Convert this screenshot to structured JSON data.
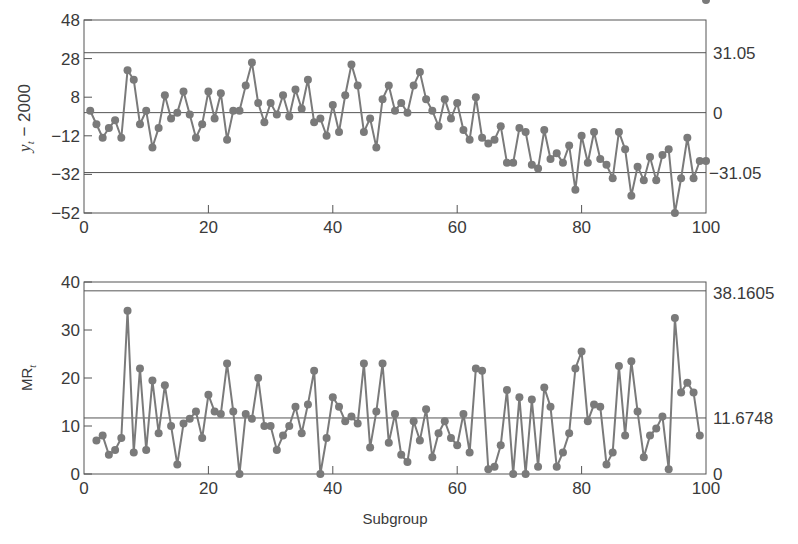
{
  "chart_data": [
    {
      "type": "line",
      "title": "",
      "xlabel": "",
      "ylabel": "y_t − 2000",
      "xlim": [
        0,
        100
      ],
      "ylim": [
        -52,
        48
      ],
      "x_ticks": [
        0,
        20,
        40,
        60,
        80,
        100
      ],
      "y_ticks": [
        48,
        28,
        8,
        -12,
        -32,
        -52
      ],
      "grid": false,
      "control_limits": {
        "UCL": 31.05,
        "CL": 0,
        "LCL": -31.05
      },
      "right_labels": [
        "31.05",
        "0",
        "-31.05"
      ],
      "series": [
        {
          "name": "y_t - 2000",
          "x": [
            1,
            2,
            3,
            4,
            5,
            6,
            7,
            8,
            9,
            10,
            11,
            12,
            13,
            14,
            15,
            16,
            17,
            18,
            19,
            20,
            21,
            22,
            23,
            24,
            25,
            26,
            27,
            28,
            29,
            30,
            31,
            32,
            33,
            34,
            35,
            36,
            37,
            38,
            39,
            40,
            41,
            42,
            43,
            44,
            45,
            46,
            47,
            48,
            49,
            50,
            51,
            52,
            53,
            54,
            55,
            56,
            57,
            58,
            59,
            60,
            61,
            62,
            63,
            64,
            65,
            66,
            67,
            68,
            69,
            70,
            71,
            72,
            73,
            74,
            75,
            76,
            77,
            78,
            79,
            80,
            81,
            82,
            83,
            84,
            85,
            86,
            87,
            88,
            89,
            90,
            91,
            92,
            93,
            94,
            95,
            96,
            97,
            98,
            99,
            100
          ],
          "values": [
            1,
            -6,
            -13,
            -8,
            -4,
            -13,
            22,
            17,
            -6,
            1,
            -18,
            -8,
            9,
            -3,
            0,
            11,
            -1,
            -13,
            -6,
            11,
            -3,
            10,
            -14,
            1,
            1,
            14,
            26,
            5,
            -5,
            5,
            -1,
            9,
            -2,
            12,
            2,
            17,
            -5,
            -3,
            -12,
            4,
            -10,
            9,
            25,
            14,
            -10,
            -3,
            -18,
            7,
            14,
            1,
            5,
            0,
            14,
            21,
            7,
            1,
            -7,
            7,
            -3,
            5,
            -9,
            -14,
            8,
            -13,
            -16,
            -14,
            -7,
            -26,
            -26,
            -8,
            -10,
            -27,
            -29,
            -9,
            -24,
            -21,
            -26,
            -17,
            -40,
            -12,
            -26,
            -10,
            -24,
            -27,
            -34,
            -10,
            -19,
            -43,
            -28,
            -35,
            -23,
            -35,
            -22,
            -19,
            -52,
            -34,
            -13,
            -34,
            -25,
            -25
          ]
        }
      ]
    },
    {
      "type": "line",
      "title": "",
      "xlabel": "Subgroup",
      "ylabel": "MR_t",
      "xlim": [
        0,
        100
      ],
      "ylim": [
        0,
        40
      ],
      "x_ticks": [
        0,
        20,
        40,
        60,
        80,
        100
      ],
      "y_ticks": [
        0,
        10,
        20,
        30,
        40
      ],
      "grid": false,
      "control_limits": {
        "UCL": 38.1605,
        "CL": 11.6748,
        "LCL": 0
      },
      "right_labels": [
        "38.1605",
        "11.6748",
        "0"
      ],
      "series": [
        {
          "name": "MR_t",
          "x": [
            2,
            3,
            4,
            5,
            6,
            7,
            8,
            9,
            10,
            11,
            12,
            13,
            14,
            15,
            16,
            17,
            18,
            19,
            20,
            21,
            22,
            23,
            24,
            25,
            26,
            27,
            28,
            29,
            30,
            31,
            32,
            33,
            34,
            35,
            36,
            37,
            38,
            39,
            40,
            41,
            42,
            43,
            44,
            45,
            46,
            47,
            48,
            49,
            50,
            51,
            52,
            53,
            54,
            55,
            56,
            57,
            58,
            59,
            60,
            61,
            62,
            63,
            64,
            65,
            66,
            67,
            68,
            69,
            70,
            71,
            72,
            73,
            74,
            75,
            76,
            77,
            78,
            79,
            80,
            81,
            82,
            83,
            84,
            85,
            86,
            87,
            88,
            89,
            90,
            91,
            92,
            93,
            94,
            95,
            96,
            97,
            98,
            99,
            100
          ],
          "values": [
            7,
            8,
            4,
            5,
            7.5,
            34,
            4.5,
            22,
            5,
            19.5,
            8.5,
            18.5,
            10,
            2,
            10.5,
            11.5,
            13,
            7.5,
            16.5,
            13,
            12.5,
            23,
            13,
            0,
            12.5,
            11.5,
            20,
            10,
            10,
            5,
            8,
            10,
            14,
            8.5,
            14.5,
            21.5,
            0,
            7.5,
            16,
            14,
            11,
            12,
            10.5,
            23,
            5.5,
            13,
            23,
            6.5,
            12.5,
            4,
            2.5,
            11,
            7,
            13.5,
            3.5,
            8.5,
            11,
            7.5,
            6,
            12.5,
            4.5,
            22,
            21.5,
            1,
            1.5,
            6,
            17.5,
            0,
            16,
            0,
            15.5,
            1.5,
            18,
            14,
            1.5,
            4.5,
            8.5,
            22,
            25.5,
            11,
            14.5,
            14,
            2,
            4.5,
            22.5,
            8,
            23.5,
            13,
            3.5,
            8,
            9.5,
            12,
            1,
            32.5,
            17,
            19,
            17,
            8
          ]
        }
      ]
    }
  ],
  "top_chart": {
    "ylabel_main": "y",
    "ylabel_sub": "t",
    "ylabel_rest": " − 2000",
    "y_tick_labels": [
      "48",
      "28",
      "8",
      "-12",
      "-32",
      "-52"
    ],
    "x_tick_labels": [
      "0",
      "20",
      "40",
      "60",
      "80",
      "100"
    ],
    "right_labels": {
      "ucl": "31.05",
      "cl": "0",
      "lcl": "−31.05"
    }
  },
  "bottom_chart": {
    "ylabel_main": "MR",
    "ylabel_sub": "t",
    "xlabel": "Subgroup",
    "y_tick_labels": [
      "40",
      "30",
      "20",
      "10",
      "0"
    ],
    "x_tick_labels": [
      "0",
      "20",
      "40",
      "60",
      "80",
      "100"
    ],
    "right_labels": {
      "ucl": "38.1605",
      "cl": "11.6748",
      "lcl": "0"
    }
  },
  "colors": {
    "line": "#7a7a7a",
    "marker": "#7a7a7a",
    "axis": "#555555",
    "text": "#3a3a3a"
  }
}
